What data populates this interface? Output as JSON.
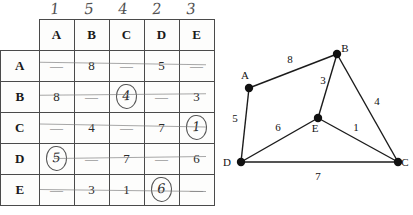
{
  "matrix": {
    "column_order_marks": [
      "1",
      "5",
      "4",
      "2",
      "3"
    ],
    "corner_label": "",
    "column_headers": [
      "A",
      "B",
      "C",
      "D",
      "E"
    ],
    "row_headers": [
      "A",
      "B",
      "C",
      "D",
      "E"
    ],
    "rows": [
      {
        "header": "A",
        "cells": [
          {
            "value": "—",
            "circled": false
          },
          {
            "value": "8",
            "circled": false
          },
          {
            "value": "—",
            "circled": false
          },
          {
            "value": "5",
            "circled": false
          },
          {
            "value": "—",
            "circled": false
          }
        ]
      },
      {
        "header": "B",
        "cells": [
          {
            "value": "8",
            "circled": false
          },
          {
            "value": "—",
            "circled": false
          },
          {
            "value": "4",
            "circled": true
          },
          {
            "value": "—",
            "circled": false
          },
          {
            "value": "3",
            "circled": false
          }
        ]
      },
      {
        "header": "C",
        "cells": [
          {
            "value": "—",
            "circled": false
          },
          {
            "value": "4",
            "circled": false
          },
          {
            "value": "—",
            "circled": false
          },
          {
            "value": "7",
            "circled": false
          },
          {
            "value": "1",
            "circled": true
          }
        ]
      },
      {
        "header": "D",
        "cells": [
          {
            "value": "5",
            "circled": true
          },
          {
            "value": "—",
            "circled": false
          },
          {
            "value": "7",
            "circled": false
          },
          {
            "value": "—",
            "circled": false
          },
          {
            "value": "6",
            "circled": false
          }
        ]
      },
      {
        "header": "E",
        "cells": [
          {
            "value": "—",
            "circled": false
          },
          {
            "value": "3",
            "circled": false
          },
          {
            "value": "1",
            "circled": false
          },
          {
            "value": "6",
            "circled": true
          },
          {
            "value": "—",
            "circled": false
          }
        ]
      }
    ]
  },
  "chart_data": {
    "type": "diagram",
    "title": "",
    "graph_kind": "undirected-weighted-graph",
    "nodes": [
      {
        "id": "A",
        "label": "A",
        "x": 39,
        "y": 88,
        "label_dx": -4,
        "label_dy": -9
      },
      {
        "id": "B",
        "label": "B",
        "x": 127,
        "y": 54,
        "label_dx": 8,
        "label_dy": -2
      },
      {
        "id": "C",
        "label": "C",
        "x": 188,
        "y": 162,
        "label_dx": 7,
        "label_dy": 4
      },
      {
        "id": "D",
        "label": "D",
        "x": 31,
        "y": 162,
        "label_dx": -14,
        "label_dy": 4
      },
      {
        "id": "E",
        "label": "E",
        "x": 108,
        "y": 118,
        "label_dx": -3,
        "label_dy": 14
      }
    ],
    "edges": [
      {
        "from": "A",
        "to": "B",
        "weight": "8",
        "label_x": 80,
        "label_y": 63
      },
      {
        "from": "A",
        "to": "D",
        "weight": "5",
        "label_x": 25,
        "label_y": 122
      },
      {
        "from": "B",
        "to": "E",
        "weight": "3",
        "label_x": 113,
        "label_y": 84
      },
      {
        "from": "B",
        "to": "C",
        "weight": "4",
        "label_x": 167,
        "label_y": 105
      },
      {
        "from": "D",
        "to": "E",
        "weight": "6",
        "label_x": 68,
        "label_y": 131
      },
      {
        "from": "E",
        "to": "C",
        "weight": "1",
        "label_x": 146,
        "label_y": 131
      },
      {
        "from": "D",
        "to": "C",
        "weight": "7",
        "label_x": 108,
        "label_y": 180
      }
    ]
  }
}
